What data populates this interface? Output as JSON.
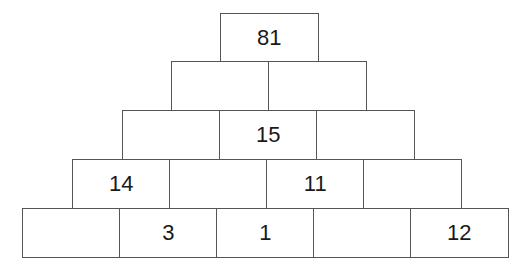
{
  "diagram": {
    "type": "number-pyramid",
    "rows": [
      [
        "81"
      ],
      [
        "",
        ""
      ],
      [
        "",
        "15",
        ""
      ],
      [
        "14",
        "",
        "11",
        ""
      ],
      [
        "",
        "3",
        "1",
        "",
        "12"
      ]
    ]
  }
}
